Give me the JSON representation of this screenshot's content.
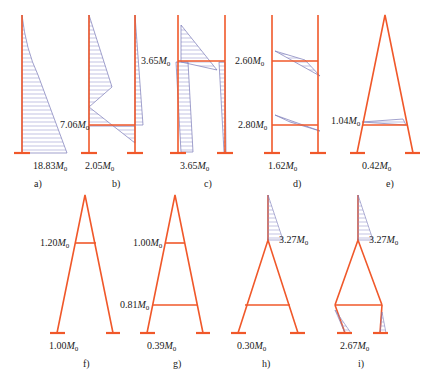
{
  "colors": {
    "frame": "#f0582a",
    "moment": "#7a7ab8",
    "hatch": "#9a9ad0",
    "text": "#222222"
  },
  "unit_symbol": "M",
  "unit_sub": "0",
  "panels": [
    {
      "caption": "a)",
      "labels": [
        {
          "value": "18.83",
          "pos": "base"
        }
      ]
    },
    {
      "caption": "b)",
      "labels": [
        {
          "value": "7.06",
          "pos": "beam"
        },
        {
          "value": "2.05",
          "pos": "base"
        }
      ]
    },
    {
      "caption": "c)",
      "labels": [
        {
          "value": "3.65",
          "pos": "beam"
        },
        {
          "value": "3.65",
          "pos": "base"
        }
      ]
    },
    {
      "caption": "d)",
      "labels": [
        {
          "value": "2.60",
          "pos": "upper-beam"
        },
        {
          "value": "2.80",
          "pos": "lower-beam"
        },
        {
          "value": "1.62",
          "pos": "base"
        }
      ]
    },
    {
      "caption": "e)",
      "labels": [
        {
          "value": "1.04",
          "pos": "beam"
        },
        {
          "value": "0.42",
          "pos": "base"
        }
      ]
    },
    {
      "caption": "f)",
      "labels": [
        {
          "value": "1.20",
          "pos": "beam"
        },
        {
          "value": "1.00",
          "pos": "base"
        }
      ]
    },
    {
      "caption": "g)",
      "labels": [
        {
          "value": "1.00",
          "pos": "upper-beam"
        },
        {
          "value": "0.81",
          "pos": "lower-beam"
        },
        {
          "value": "0.39",
          "pos": "base"
        }
      ]
    },
    {
      "caption": "h)",
      "labels": [
        {
          "value": "3.27",
          "pos": "apex"
        },
        {
          "value": "0.30",
          "pos": "base"
        }
      ]
    },
    {
      "caption": "i)",
      "labels": [
        {
          "value": "3.27",
          "pos": "apex"
        },
        {
          "value": "2.67",
          "pos": "base"
        }
      ]
    }
  ]
}
